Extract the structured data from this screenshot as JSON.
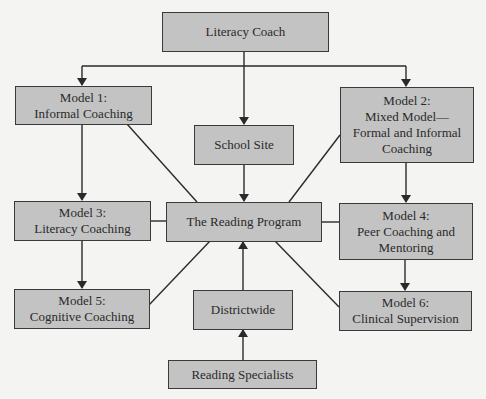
{
  "colors": {
    "background": "#f4f4f2",
    "box_fill": "#c3c3c3",
    "box_border": "#3a3a3a",
    "line": "#2a2a2a",
    "text": "#2a2a2a"
  },
  "nodes": {
    "literacy_coach": {
      "label": "Literacy Coach"
    },
    "model1": {
      "label": "Model 1:\nInformal Coaching"
    },
    "model2": {
      "label": "Model 2:\nMixed Model—\nFormal and Informal\nCoaching"
    },
    "school_site": {
      "label": "School Site"
    },
    "model3": {
      "label": "Model 3:\nLiteracy Coaching"
    },
    "reading_program": {
      "label": "The Reading Program"
    },
    "model4": {
      "label": "Model 4:\nPeer Coaching and\nMentoring"
    },
    "model5": {
      "label": "Model 5:\nCognitive Coaching"
    },
    "districtwide": {
      "label": "Districtwide"
    },
    "model6": {
      "label": "Model 6:\nClinical Supervision"
    },
    "reading_specialists": {
      "label": "Reading Specialists"
    }
  },
  "edges": [
    {
      "from": "literacy_coach",
      "to": "model1",
      "arrow": true
    },
    {
      "from": "literacy_coach",
      "to": "school_site",
      "arrow": true
    },
    {
      "from": "literacy_coach",
      "to": "model2",
      "arrow": true
    },
    {
      "from": "model1",
      "to": "model3",
      "arrow": true
    },
    {
      "from": "model3",
      "to": "model5",
      "arrow": true
    },
    {
      "from": "model2",
      "to": "model4",
      "arrow": true
    },
    {
      "from": "model4",
      "to": "model6",
      "arrow": true
    },
    {
      "from": "school_site",
      "to": "reading_program",
      "arrow": true
    },
    {
      "from": "districtwide",
      "to": "reading_program",
      "arrow": true
    },
    {
      "from": "reading_specialists",
      "to": "districtwide",
      "arrow": true
    },
    {
      "from": "model1",
      "to": "reading_program",
      "arrow": false
    },
    {
      "from": "model2",
      "to": "reading_program",
      "arrow": false
    },
    {
      "from": "model3",
      "to": "reading_program",
      "arrow": false
    },
    {
      "from": "model4",
      "to": "reading_program",
      "arrow": false
    },
    {
      "from": "model5",
      "to": "reading_program",
      "arrow": false
    },
    {
      "from": "model6",
      "to": "reading_program",
      "arrow": false
    }
  ]
}
